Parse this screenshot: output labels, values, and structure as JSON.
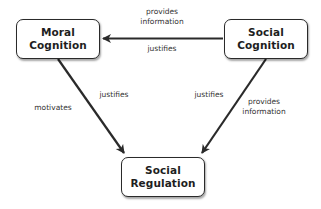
{
  "diagram": {
    "nodes": [
      {
        "id": "moral-cognition",
        "line1": "Moral",
        "line2": "Cognition"
      },
      {
        "id": "social-cognition",
        "line1": "Social",
        "line2": "Cognition"
      },
      {
        "id": "social-regulation",
        "line1": "Social",
        "line2": "Regulation"
      }
    ],
    "edges": [
      {
        "from": "social-cognition",
        "to": "moral-cognition",
        "labels": {
          "above_line1": "provides",
          "above_line2": "information",
          "below": "justifies"
        }
      },
      {
        "from": "moral-cognition",
        "to": "social-regulation",
        "labels": {
          "left": "motivates",
          "right": "justifies"
        }
      },
      {
        "from": "social-cognition",
        "to": "social-regulation",
        "labels": {
          "left": "justifies",
          "right_line1": "provides",
          "right_line2": "information"
        }
      }
    ],
    "colors": {
      "stroke": "#2a2a2a",
      "text": "#1e1e1e",
      "label": "#333333",
      "background": "#ffffff"
    }
  }
}
